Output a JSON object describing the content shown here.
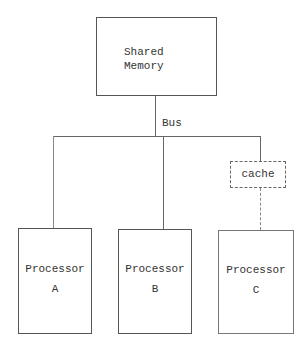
{
  "diagram": {
    "memory": {
      "line1": "Shared",
      "line2": "Memory"
    },
    "bus_label": "Bus",
    "cache_label": "cache",
    "processors": [
      {
        "name": "Processor",
        "id": "A"
      },
      {
        "name": "Processor",
        "id": "B"
      },
      {
        "name": "Processor",
        "id": "C"
      }
    ]
  }
}
